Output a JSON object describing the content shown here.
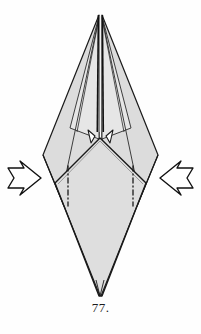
{
  "figure": {
    "caption": "77.",
    "colors": {
      "paper_fill": "#dcdcdc",
      "paper_fill_light": "#e6e6e6",
      "paper_fill_front": "#dedede",
      "outline": "#1a1a1a",
      "crease": "#2a2a2a",
      "background": "#fefefe",
      "arrow_fill": "#ffffff",
      "arrow_stroke": "#111111"
    },
    "geometry": {
      "top_apex_x": 100,
      "top_apex_y": 14,
      "bottom_apex_x": 100,
      "bottom_apex_y": 296,
      "left_widest_x": 43,
      "left_widest_y": 155,
      "right_widest_x": 158,
      "right_widest_y": 155,
      "front_flap_apex_y": 138
    },
    "elements": [
      {
        "name": "left-back-wing",
        "type": "polygon",
        "label": "Left rear flap"
      },
      {
        "name": "right-back-wing",
        "type": "polygon",
        "label": "Right rear flap"
      },
      {
        "name": "front-flap",
        "type": "polygon",
        "label": "Front kite flap"
      },
      {
        "name": "center-spine",
        "type": "line",
        "label": "Central vertical spine"
      },
      {
        "name": "left-notch-spike",
        "type": "polygon",
        "label": "Left small triangular notch"
      },
      {
        "name": "right-notch-spike",
        "type": "polygon",
        "label": "Right small triangular notch"
      },
      {
        "name": "left-mountain-fold",
        "type": "dash-dot-line",
        "label": "Left mountain fold line"
      },
      {
        "name": "right-mountain-fold",
        "type": "dash-dot-line",
        "label": "Right mountain fold line"
      }
    ],
    "arrows": [
      {
        "name": "left-push-arrow",
        "direction": "right",
        "tip_x": 45,
        "center_y": 178,
        "label": "Push in from the left"
      },
      {
        "name": "right-push-arrow",
        "direction": "left",
        "tip_x": 156,
        "center_y": 178,
        "label": "Push in from the right"
      }
    ]
  }
}
